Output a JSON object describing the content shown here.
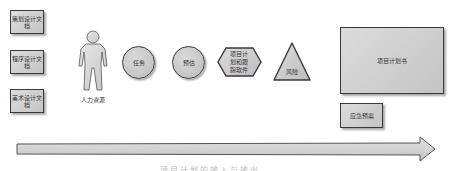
{
  "diagram": {
    "documents": [
      {
        "label": "策划设计文档"
      },
      {
        "label": "程序设计文档"
      },
      {
        "label": "美术设计文档"
      }
    ],
    "human_resource": {
      "label": "人力资源",
      "icon": "person-icon"
    },
    "task": {
      "label": "任务",
      "shape": "circle"
    },
    "estimate": {
      "label": "预估",
      "shape": "circle"
    },
    "tracking_software": {
      "label": "项目计划和跟踪软件",
      "lines": [
        "项目计",
        "划和跟",
        "踪软件"
      ],
      "shape": "hexagon"
    },
    "risk": {
      "label": "风险",
      "shape": "triangle"
    },
    "project_plan": {
      "label": "项目计划书",
      "shape": "rectangle"
    },
    "contingency_plan": {
      "label": "应急预案",
      "shape": "rectangle"
    },
    "timeline_arrow": {
      "direction": "right"
    },
    "caption_partial": "项目计划的输入与输出"
  },
  "colors": {
    "shape_fill": "#c8c8c8",
    "shape_border": "#3a3a3a",
    "text": "#333333",
    "background": "#ffffff"
  }
}
